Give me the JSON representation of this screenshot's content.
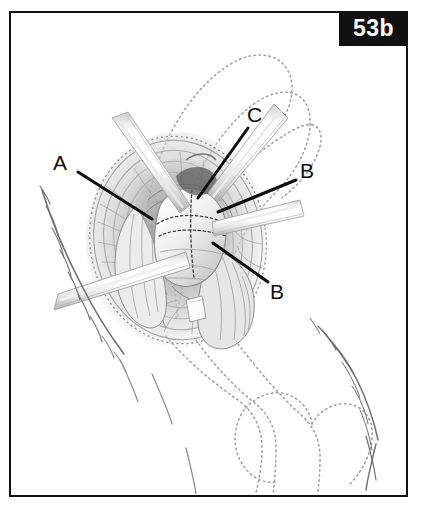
{
  "figure": {
    "badge_label": "53b",
    "badge_bg": "#111111",
    "badge_text_color": "#ffffff",
    "frame_color": "#111111",
    "background": "#ffffff"
  },
  "callouts": [
    {
      "label": "A",
      "x": 53,
      "y": 152,
      "line_x1": 78,
      "line_y1": 172,
      "line_x2": 152,
      "line_y2": 219
    },
    {
      "label": "C",
      "x": 247,
      "y": 104,
      "line_x1": 248,
      "line_y1": 128,
      "line_x2": 198,
      "line_y2": 198
    },
    {
      "label": "B",
      "x": 300,
      "y": 160,
      "line_x1": 296,
      "line_y1": 180,
      "line_x2": 218,
      "line_y2": 212
    },
    {
      "label": "B",
      "x": 270,
      "y": 281,
      "line_x1": 268,
      "line_y1": 282,
      "line_x2": 213,
      "line_y2": 243
    }
  ],
  "artwork": {
    "ink_color": "#4a4a4a",
    "dotted_outline_color": "#9a9a9a",
    "shading_color": "#8d8d8d",
    "retractor_fill": "#f2f2f2",
    "retractor_edge": "#b5b5b5",
    "femoral_head_fill": "#efefef",
    "description": "Hip joint surgical exposure with four radiating retractors, femoral head with dotted suture lines, surrounding soft tissue shading, and dotted pelvis and femur bone outlines"
  }
}
